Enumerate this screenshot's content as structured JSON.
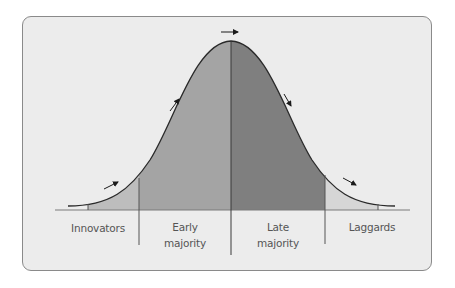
{
  "diagram": {
    "type": "bell-curve",
    "title": "",
    "segments": [
      {
        "id": "innovators",
        "label": "Innovators",
        "color": "#bdbdbd"
      },
      {
        "id": "early-majority",
        "label": "Early majority",
        "line1": "Early",
        "line2": "majority",
        "color": "#a4a4a4"
      },
      {
        "id": "late-majority",
        "label": "Late majority",
        "line1": "Late",
        "line2": "majority",
        "color": "#7f7f7f"
      },
      {
        "id": "laggards",
        "label": "Laggards",
        "color": "#d6d6d6"
      }
    ],
    "arrows": [
      {
        "position": "innovators-slope",
        "direction": "up-right"
      },
      {
        "position": "early-majority-slope",
        "direction": "up-right"
      },
      {
        "position": "peak",
        "direction": "right"
      },
      {
        "position": "late-majority-slope",
        "direction": "down-right"
      },
      {
        "position": "laggards-slope",
        "direction": "down-right"
      }
    ],
    "colors": {
      "background": "#ececec",
      "border": "#8a8a8a",
      "curve": "#2a2a2a",
      "axis": "#7a7a7a",
      "text": "#555555"
    }
  }
}
